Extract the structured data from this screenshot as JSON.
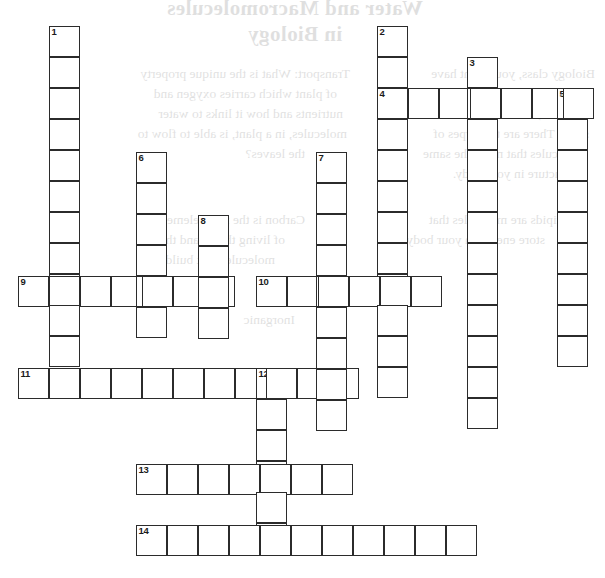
{
  "page": {
    "type": "crossword-puzzle-worksheet",
    "width": 605,
    "height": 578,
    "background_color": "#ffffff",
    "cell_size": 31,
    "cell_border_color": "#2b2b2b"
  },
  "showthrough": {
    "note": "faint mirror-image text bleeding through from the reverse side of the sheet",
    "title_lines": [
      "Water and Macromolecules",
      "in Biology"
    ],
    "left_column_lines": [
      "Transport: What is the unique property",
      "of plant which carries oxygen and",
      "nutrients and how it links to water",
      "molecules, in a plant, is able to flow to",
      "the leaves?"
    ],
    "right_column_lines": [
      "Biology class, you might have",
      "the same structure as the",
      "however, structure will not be",
      "same. There are two types of",
      "molecules that make the same",
      "structure in your body."
    ],
    "mid_left_lines": [
      "Carbon is the main element",
      "of living things and the",
      "molecules that build it.",
      "Inorganic"
    ],
    "lower_left_lines": [
      "Lipids are molecules that",
      "store energy in your body"
    ]
  },
  "grid": {
    "origin_x": 18,
    "origin_y": 26,
    "cells": [
      {
        "n": 1,
        "x": 49,
        "y": 26,
        "num": "1"
      },
      {
        "x": 49,
        "y": 57
      },
      {
        "x": 49,
        "y": 88
      },
      {
        "x": 49,
        "y": 119
      },
      {
        "x": 49,
        "y": 150
      },
      {
        "x": 49,
        "y": 181
      },
      {
        "x": 49,
        "y": 212
      },
      {
        "x": 49,
        "y": 243
      },
      {
        "x": 49,
        "y": 276
      },
      {
        "x": 49,
        "y": 307
      },
      {
        "n": 2,
        "x": 377,
        "y": 26,
        "num": "2"
      },
      {
        "x": 377,
        "y": 57
      },
      {
        "x": 377,
        "y": 119
      },
      {
        "x": 377,
        "y": 150
      },
      {
        "x": 377,
        "y": 181
      },
      {
        "x": 377,
        "y": 212
      },
      {
        "x": 377,
        "y": 243
      },
      {
        "x": 377,
        "y": 307
      },
      {
        "x": 377,
        "y": 338
      },
      {
        "x": 377,
        "y": 369
      },
      {
        "n": 3,
        "x": 467,
        "y": 57,
        "num": "3"
      },
      {
        "x": 467,
        "y": 119
      },
      {
        "x": 467,
        "y": 150
      },
      {
        "x": 467,
        "y": 181
      },
      {
        "x": 467,
        "y": 212
      },
      {
        "x": 467,
        "y": 243
      },
      {
        "x": 467,
        "y": 307
      },
      {
        "x": 467,
        "y": 338
      },
      {
        "x": 467,
        "y": 369
      },
      {
        "x": 467,
        "y": 400
      },
      {
        "n": 4,
        "x": 377,
        "y": 88,
        "num": "4"
      },
      {
        "x": 408,
        "y": 88
      },
      {
        "x": 439,
        "y": 88
      },
      {
        "x": 467,
        "y": 88
      },
      {
        "x": 498,
        "y": 88
      },
      {
        "x": 529,
        "y": 88
      },
      {
        "n": 5,
        "x": 557,
        "y": 88,
        "num": "5"
      },
      {
        "x": 557,
        "y": 119
      },
      {
        "x": 557,
        "y": 150
      },
      {
        "x": 557,
        "y": 181
      },
      {
        "x": 557,
        "y": 212
      },
      {
        "x": 557,
        "y": 243
      },
      {
        "x": 557,
        "y": 276
      },
      {
        "x": 557,
        "y": 307
      },
      {
        "x": 557,
        "y": 338
      },
      {
        "n": 6,
        "x": 136,
        "y": 152,
        "num": "6"
      },
      {
        "x": 136,
        "y": 183
      },
      {
        "x": 136,
        "y": 214
      },
      {
        "x": 136,
        "y": 245
      },
      {
        "x": 136,
        "y": 307
      },
      {
        "n": 7,
        "x": 316,
        "y": 152,
        "num": "7"
      },
      {
        "x": 316,
        "y": 183
      },
      {
        "x": 316,
        "y": 214
      },
      {
        "x": 316,
        "y": 245
      },
      {
        "x": 316,
        "y": 307
      },
      {
        "x": 316,
        "y": 338
      },
      {
        "x": 316,
        "y": 369
      },
      {
        "x": 316,
        "y": 400
      },
      {
        "n": 8,
        "x": 198,
        "y": 215,
        "num": "8"
      },
      {
        "x": 198,
        "y": 246
      },
      {
        "x": 198,
        "y": 307
      },
      {
        "n": 9,
        "x": 18,
        "y": 276,
        "num": "9"
      },
      {
        "x": 79,
        "y": 276
      },
      {
        "x": 110,
        "y": 276
      },
      {
        "x": 167,
        "y": 276
      },
      {
        "x": 229,
        "y": 276
      },
      {
        "n": 10,
        "x": 256,
        "y": 276,
        "num": "10"
      },
      {
        "x": 287,
        "y": 276
      },
      {
        "x": 347,
        "y": 276
      },
      {
        "x": 378,
        "y": 276
      },
      {
        "x": 409,
        "y": 276
      },
      {
        "n": 11,
        "x": 18,
        "y": 368,
        "num": "11"
      },
      {
        "x": 49,
        "y": 368
      },
      {
        "x": 80,
        "y": 368
      },
      {
        "x": 111,
        "y": 368
      },
      {
        "x": 167,
        "y": 368
      },
      {
        "x": 198,
        "y": 368
      },
      {
        "x": 229,
        "y": 368
      },
      {
        "n": 12,
        "x": 256,
        "y": 368,
        "num": "12"
      },
      {
        "x": 287,
        "y": 368
      },
      {
        "x": 318,
        "y": 368
      },
      {
        "x": 256,
        "y": 399
      },
      {
        "x": 256,
        "y": 430
      },
      {
        "x": 256,
        "y": 495
      },
      {
        "x": 256,
        "y": 526
      },
      {
        "n": 13,
        "x": 136,
        "y": 464,
        "num": "13"
      },
      {
        "x": 167,
        "y": 464
      },
      {
        "x": 198,
        "y": 464
      },
      {
        "x": 229,
        "y": 464
      },
      {
        "x": 287,
        "y": 464
      },
      {
        "x": 318,
        "y": 464
      },
      {
        "n": 14,
        "x": 136,
        "y": 525,
        "num": "14"
      },
      {
        "x": 167,
        "y": 525
      },
      {
        "x": 198,
        "y": 525
      },
      {
        "x": 229,
        "y": 525
      },
      {
        "x": 287,
        "y": 525
      },
      {
        "x": 318,
        "y": 525
      },
      {
        "x": 349,
        "y": 525
      },
      {
        "x": 380,
        "y": 525
      },
      {
        "x": 411,
        "y": 525
      },
      {
        "x": 442,
        "y": 525
      }
    ],
    "numbers": [
      "1",
      "2",
      "3",
      "4",
      "5",
      "6",
      "7",
      "8",
      "9",
      "10",
      "11",
      "12",
      "13",
      "14"
    ],
    "entries": {
      "down": [
        {
          "number": "1",
          "start_x": 49,
          "start_y": 26,
          "length": 11
        },
        {
          "number": "2",
          "start_x": 377,
          "start_y": 26,
          "length": 12
        },
        {
          "number": "3",
          "start_x": 467,
          "start_y": 57,
          "length": 12
        },
        {
          "number": "5",
          "start_x": 557,
          "start_y": 88,
          "length": 9
        },
        {
          "number": "6",
          "start_x": 136,
          "start_y": 152,
          "length": 6
        },
        {
          "number": "7",
          "start_x": 316,
          "start_y": 152,
          "length": 9
        },
        {
          "number": "8",
          "start_x": 198,
          "start_y": 215,
          "length": 4
        },
        {
          "number": "12",
          "start_x": 256,
          "start_y": 368,
          "length": 6
        }
      ],
      "across": [
        {
          "number": "4",
          "start_x": 377,
          "start_y": 88,
          "length": 7
        },
        {
          "number": "9",
          "start_x": 18,
          "start_y": 276,
          "length": 7
        },
        {
          "number": "10",
          "start_x": 256,
          "start_y": 276,
          "length": 6
        },
        {
          "number": "11",
          "start_x": 18,
          "start_y": 368,
          "length": 11
        },
        {
          "number": "13",
          "start_x": 136,
          "start_y": 464,
          "length": 7
        },
        {
          "number": "14",
          "start_x": 136,
          "start_y": 525,
          "length": 11
        }
      ]
    }
  }
}
